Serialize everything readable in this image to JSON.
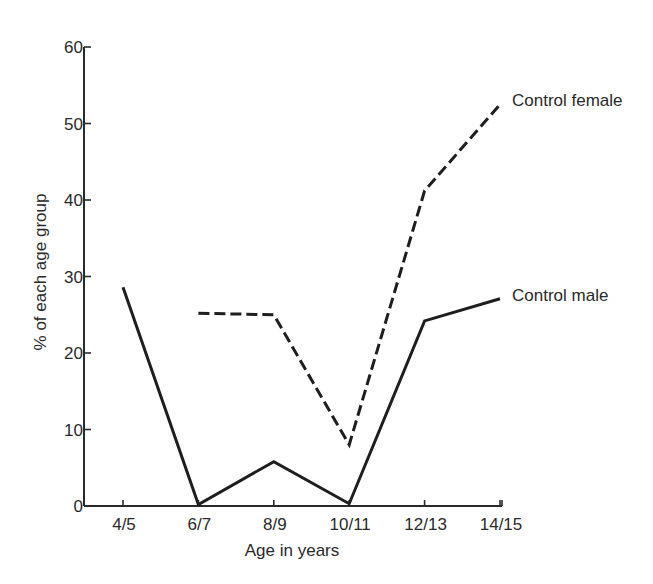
{
  "chart_data": {
    "type": "line",
    "title": "",
    "xlabel": "Age in years",
    "ylabel": "% of each age group",
    "categories": [
      "4/5",
      "6/7",
      "8/9",
      "10/11",
      "12/13",
      "14/15"
    ],
    "ylim": [
      0,
      60
    ],
    "yticks": [
      0,
      10,
      20,
      30,
      40,
      50,
      60
    ],
    "grid": false,
    "legend_position": "inline labels at right end of lines",
    "series": [
      {
        "name": "Control female",
        "style": "dashed",
        "values": [
          null,
          25.2,
          25.0,
          8.0,
          41.2,
          52.5
        ]
      },
      {
        "name": "Control male",
        "style": "solid",
        "values": [
          28.6,
          0.2,
          5.8,
          0.3,
          24.2,
          27.1
        ]
      }
    ]
  },
  "colors": {
    "line": "#1e1e1e",
    "axis": "#2a2a2a",
    "background": "#ffffff"
  }
}
